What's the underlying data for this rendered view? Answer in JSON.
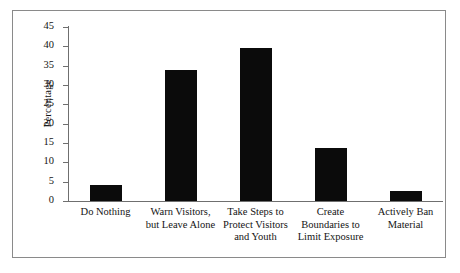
{
  "chart_data": {
    "type": "bar",
    "title": "",
    "subtitle": "",
    "xlabel": "",
    "ylabel": "Percentage",
    "ylim": [
      0,
      45
    ],
    "ytick_values": [
      0,
      5,
      10,
      15,
      20,
      25,
      30,
      35,
      40,
      45
    ],
    "ytick_labels": [
      "0",
      "5",
      "10",
      "15",
      "20",
      "25",
      "30",
      "35",
      "40",
      "45"
    ],
    "grid": false,
    "legend": null,
    "bar_color": "#0b0b0b",
    "axis_color": "#6f6f6f",
    "frame_color": "#8a8a8a",
    "background": "#ffffff",
    "categories": [
      "Do Nothing",
      "Warn Visitors, but Leave Alone",
      "Take Steps to Protect Visitors and Youth",
      "Create Boundaries to Limit Exposure",
      "Actively Ban Material"
    ],
    "category_lines": [
      [
        "Do Nothing"
      ],
      [
        "Warn Visitors,",
        "but Leave Alone"
      ],
      [
        "Take Steps to",
        "Protect Visitors",
        "and Youth"
      ],
      [
        "Create",
        "Boundaries to",
        "Limit Exposure"
      ],
      [
        "Actively Ban",
        "Material"
      ]
    ],
    "values": [
      4.1,
      34.0,
      39.6,
      13.6,
      2.5
    ]
  },
  "axis": {
    "y_title": "Percentage"
  }
}
